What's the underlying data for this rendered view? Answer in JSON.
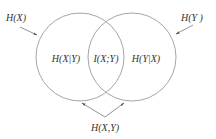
{
  "diagram": {
    "type": "venn",
    "colors": {
      "circle_stroke": "#9a9a9a",
      "text": "#333333",
      "arrow": "#777777"
    },
    "sets": [
      {
        "id": "X",
        "label": "H(X)"
      },
      {
        "id": "Y",
        "label": "H(Y )"
      }
    ],
    "regions": {
      "left_only": "H(X|Y)",
      "intersection": "I(X;Y)",
      "right_only": "H(Y|X)"
    },
    "union_label": "H(X,Y)"
  }
}
